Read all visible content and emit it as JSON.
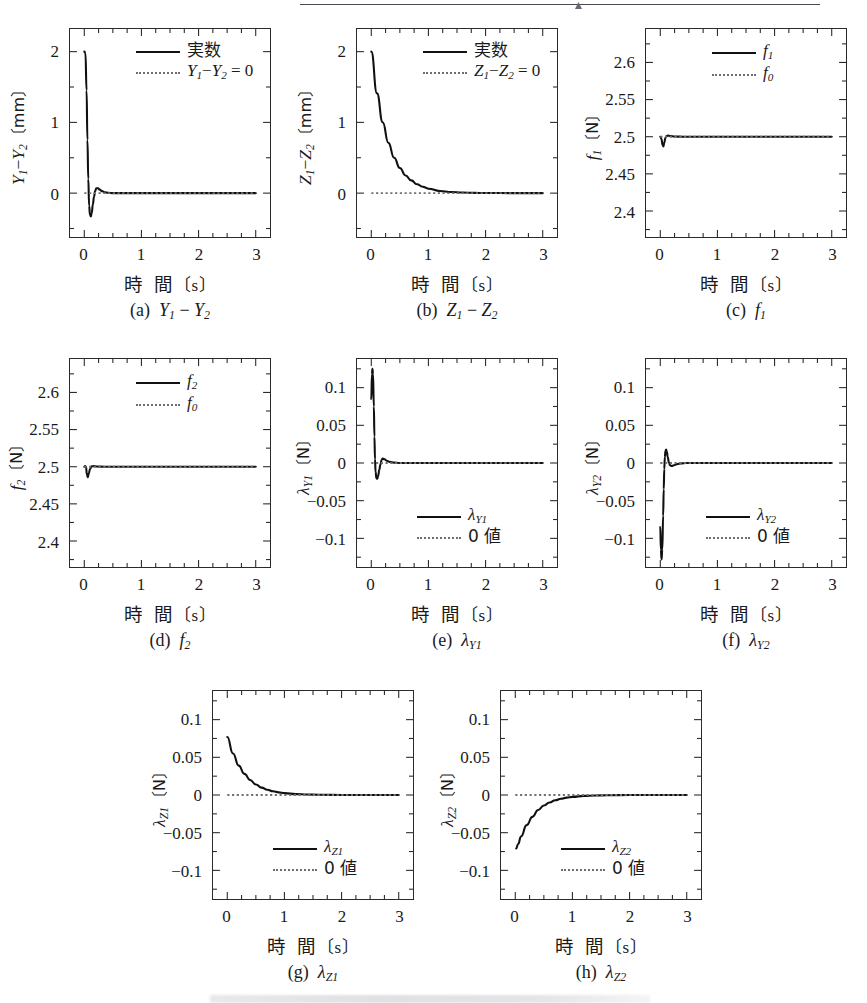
{
  "figure": {
    "layout": "3 rows of subplots (3 + 3 + 2), scanned journal page",
    "xaxis_title_main": "時",
    "xaxis_title_second": "間",
    "xaxis_unit": "〔s〕",
    "x_ticks": [
      "0",
      "1",
      "2",
      "3"
    ],
    "x_range": [
      -0.25,
      3.25
    ]
  },
  "chart_data": [
    {
      "id": "a",
      "type": "line",
      "caption_prefix": "(a)",
      "caption_body": "Y₁ − Y₂",
      "ylabel_main": "Y₁−Y₂",
      "ylabel_unit": "〔mm〕",
      "xlabel": "時　間〔s〕",
      "ylim": [
        -0.62,
        2.32
      ],
      "xlim": [
        -0.25,
        3.25
      ],
      "y_ticks": [
        "0",
        "1",
        "2"
      ],
      "y_tick_values": [
        0,
        1,
        2
      ],
      "x_ticks": [
        "0",
        "1",
        "2",
        "3"
      ],
      "grid": false,
      "legend_position": "top-right",
      "series": [
        {
          "name": "実数",
          "style": "solid",
          "description": "starts at 2.0, drops sharply to -0.33 at t≈0.11, overshoots to +0.07 at t≈0.22, settles to 0",
          "points": [
            [
              0,
              2.0
            ],
            [
              0.02,
              1.98
            ],
            [
              0.04,
              1.45
            ],
            [
              0.055,
              0.75
            ],
            [
              0.07,
              0.2
            ],
            [
              0.085,
              -0.18
            ],
            [
              0.1,
              -0.31
            ],
            [
              0.115,
              -0.33
            ],
            [
              0.13,
              -0.28
            ],
            [
              0.15,
              -0.16
            ],
            [
              0.17,
              -0.05
            ],
            [
              0.19,
              0.03
            ],
            [
              0.21,
              0.068
            ],
            [
              0.24,
              0.07
            ],
            [
              0.27,
              0.05
            ],
            [
              0.31,
              0.028
            ],
            [
              0.36,
              0.012
            ],
            [
              0.42,
              0.004
            ],
            [
              0.5,
              0.0
            ],
            [
              0.7,
              0.0
            ],
            [
              1.0,
              0.0
            ],
            [
              1.5,
              0.0
            ],
            [
              2.0,
              0.0
            ],
            [
              2.5,
              0.0
            ],
            [
              3.0,
              0.0
            ]
          ]
        },
        {
          "name": "Y₁−Y₂ = 0",
          "style": "dotted",
          "description": "horizontal reference line at zero",
          "constant": 0
        }
      ]
    },
    {
      "id": "b",
      "type": "line",
      "caption_prefix": "(b)",
      "caption_body": "Z₁ − Z₂",
      "ylabel_main": "Z₁−Z₂",
      "ylabel_unit": "〔mm〕",
      "xlabel": "時　間〔s〕",
      "ylim": [
        -0.62,
        2.32
      ],
      "xlim": [
        -0.25,
        3.25
      ],
      "y_ticks": [
        "0",
        "1",
        "2"
      ],
      "y_tick_values": [
        0,
        1,
        2
      ],
      "x_ticks": [
        "0",
        "1",
        "2",
        "3"
      ],
      "grid": false,
      "legend_position": "top-right",
      "series": [
        {
          "name": "実数",
          "style": "solid",
          "description": "smooth exponential decay from 2.0 to 0, time constant ≈ 0.29 s",
          "points": [
            [
              0,
              2.0
            ],
            [
              0.1,
              1.41
            ],
            [
              0.2,
              1.0
            ],
            [
              0.3,
              0.71
            ],
            [
              0.4,
              0.5
            ],
            [
              0.5,
              0.355
            ],
            [
              0.6,
              0.25
            ],
            [
              0.7,
              0.18
            ],
            [
              0.8,
              0.125
            ],
            [
              0.9,
              0.09
            ],
            [
              1.0,
              0.063
            ],
            [
              1.2,
              0.031
            ],
            [
              1.4,
              0.015
            ],
            [
              1.6,
              0.008
            ],
            [
              1.8,
              0.004
            ],
            [
              2.0,
              0.002
            ],
            [
              2.5,
              0.0
            ],
            [
              3.0,
              0.0
            ]
          ]
        },
        {
          "name": "Z₁−Z₂ = 0",
          "style": "dotted",
          "description": "horizontal reference line at zero",
          "constant": 0
        }
      ]
    },
    {
      "id": "c",
      "type": "line",
      "caption_prefix": "(c)",
      "caption_body": "f₁",
      "ylabel_main": "f₁",
      "ylabel_unit": "〔N〕",
      "xlabel": "時　間〔s〕",
      "ylim": [
        2.365,
        2.645
      ],
      "xlim": [
        -0.25,
        3.25
      ],
      "y_ticks": [
        "2.4",
        "2.45",
        "2.5",
        "2.55",
        "2.6"
      ],
      "y_tick_values": [
        2.4,
        2.45,
        2.5,
        2.55,
        2.6
      ],
      "x_ticks": [
        "0",
        "1",
        "2",
        "3"
      ],
      "grid": false,
      "legend_position": "top-right",
      "series": [
        {
          "name": "f₁",
          "style": "solid",
          "description": "small dip to 2.487 near t≈0.05 then flat at 2.5",
          "points": [
            [
              0,
              2.5
            ],
            [
              0.02,
              2.497
            ],
            [
              0.04,
              2.489
            ],
            [
              0.055,
              2.487
            ],
            [
              0.07,
              2.492
            ],
            [
              0.09,
              2.4985
            ],
            [
              0.11,
              2.501
            ],
            [
              0.14,
              2.5015
            ],
            [
              0.18,
              2.5008
            ],
            [
              0.25,
              2.5002
            ],
            [
              0.4,
              2.5
            ],
            [
              1.0,
              2.5
            ],
            [
              2.0,
              2.5
            ],
            [
              3.0,
              2.5
            ]
          ]
        },
        {
          "name": "f₀",
          "style": "dotted",
          "description": "horizontal reference line at 2.5 N",
          "constant": 2.5
        }
      ]
    },
    {
      "id": "d",
      "type": "line",
      "caption_prefix": "(d)",
      "caption_body": "f₂",
      "ylabel_main": "f₂",
      "ylabel_unit": "〔N〕",
      "xlabel": "時　間〔s〕",
      "ylim": [
        2.365,
        2.645
      ],
      "xlim": [
        -0.25,
        3.25
      ],
      "y_ticks": [
        "2.4",
        "2.45",
        "2.5",
        "2.55",
        "2.6"
      ],
      "y_tick_values": [
        2.4,
        2.45,
        2.5,
        2.55,
        2.6
      ],
      "x_ticks": [
        "0",
        "1",
        "2",
        "3"
      ],
      "grid": false,
      "legend_position": "top-right",
      "series": [
        {
          "name": "f₂",
          "style": "solid",
          "description": "brief dip to 2.486 near t≈0.06 then flat at 2.5",
          "points": [
            [
              0,
              2.5
            ],
            [
              0.015,
              2.501
            ],
            [
              0.03,
              2.4995
            ],
            [
              0.045,
              2.49
            ],
            [
              0.06,
              2.486
            ],
            [
              0.08,
              2.491
            ],
            [
              0.1,
              2.497
            ],
            [
              0.13,
              2.5005
            ],
            [
              0.17,
              2.5008
            ],
            [
              0.22,
              2.5002
            ],
            [
              0.35,
              2.5
            ],
            [
              1.0,
              2.5
            ],
            [
              2.0,
              2.5
            ],
            [
              3.0,
              2.5
            ]
          ]
        },
        {
          "name": "f₀",
          "style": "dotted",
          "description": "horizontal reference line at 2.5 N",
          "constant": 2.5
        }
      ]
    },
    {
      "id": "e",
      "type": "line",
      "caption_prefix": "(e)",
      "caption_body": "λ_Y1",
      "ylabel_main": "λ_Y1",
      "ylabel_unit": "〔N〕",
      "xlabel": "時　間〔s〕",
      "ylim": [
        -0.138,
        0.138
      ],
      "xlim": [
        -0.25,
        3.25
      ],
      "y_ticks": [
        "-0.1",
        "-0.05",
        "0",
        "0.05",
        "0.1"
      ],
      "y_tick_values": [
        -0.1,
        -0.05,
        0,
        0.05,
        0.1
      ],
      "x_ticks": [
        "0",
        "1",
        "2",
        "3"
      ],
      "grid": false,
      "legend_position": "bottom-center",
      "series": [
        {
          "name": "λ_Y1",
          "style": "solid",
          "description": "spikes to +0.125 at t≈0.02, crosses zero at t≈0.07, min -0.021 at t≈0.11, small bump +0.006, settles to 0",
          "points": [
            [
              0,
              0.085
            ],
            [
              0.012,
              0.118
            ],
            [
              0.02,
              0.125
            ],
            [
              0.03,
              0.118
            ],
            [
              0.045,
              0.075
            ],
            [
              0.055,
              0.035
            ],
            [
              0.065,
              0.005
            ],
            [
              0.075,
              -0.012
            ],
            [
              0.09,
              -0.02
            ],
            [
              0.105,
              -0.021
            ],
            [
              0.12,
              -0.017
            ],
            [
              0.14,
              -0.009
            ],
            [
              0.16,
              -0.002
            ],
            [
              0.18,
              0.004
            ],
            [
              0.2,
              0.006
            ],
            [
              0.23,
              0.005
            ],
            [
              0.27,
              0.003
            ],
            [
              0.32,
              0.0015
            ],
            [
              0.4,
              0.0005
            ],
            [
              0.5,
              0.0
            ],
            [
              1.0,
              0.0
            ],
            [
              2.0,
              0.0
            ],
            [
              3.0,
              0.0
            ]
          ]
        },
        {
          "name": "0 値",
          "style": "dotted",
          "description": "horizontal reference line at zero",
          "constant": 0
        }
      ]
    },
    {
      "id": "f",
      "type": "line",
      "caption_prefix": "(f)",
      "caption_body": "λ_Y2",
      "ylabel_main": "λ_Y2",
      "ylabel_unit": "〔N〕",
      "xlabel": "時　間〔s〕",
      "ylim": [
        -0.138,
        0.138
      ],
      "xlim": [
        -0.25,
        3.25
      ],
      "y_ticks": [
        "-0.1",
        "-0.05",
        "0",
        "0.05",
        "0.1"
      ],
      "y_tick_values": [
        -0.1,
        -0.05,
        0,
        0.05,
        0.1
      ],
      "x_ticks": [
        "0",
        "1",
        "2",
        "3"
      ],
      "grid": false,
      "legend_position": "bottom-center",
      "series": [
        {
          "name": "λ_Y2",
          "style": "solid",
          "description": "starts -0.085, drops to -0.128 at t≈0.025, rises through zero at t≈0.075, peaks +0.018 at t≈0.10, settles to 0",
          "points": [
            [
              0,
              -0.085
            ],
            [
              0.01,
              -0.115
            ],
            [
              0.022,
              -0.128
            ],
            [
              0.035,
              -0.115
            ],
            [
              0.05,
              -0.07
            ],
            [
              0.06,
              -0.035
            ],
            [
              0.07,
              -0.008
            ],
            [
              0.08,
              0.008
            ],
            [
              0.09,
              0.016
            ],
            [
              0.102,
              0.018
            ],
            [
              0.115,
              0.015
            ],
            [
              0.13,
              0.008
            ],
            [
              0.15,
              0.001
            ],
            [
              0.17,
              -0.003
            ],
            [
              0.2,
              -0.004
            ],
            [
              0.24,
              -0.003
            ],
            [
              0.29,
              -0.0015
            ],
            [
              0.36,
              -0.0005
            ],
            [
              0.45,
              0.0
            ],
            [
              1.0,
              0.0
            ],
            [
              2.0,
              0.0
            ],
            [
              3.0,
              0.0
            ]
          ]
        },
        {
          "name": "0 値",
          "style": "dotted",
          "description": "horizontal reference line at zero",
          "constant": 0
        }
      ]
    },
    {
      "id": "g",
      "type": "line",
      "caption_prefix": "(g)",
      "caption_body": "λ_Z1",
      "ylabel_main": "λ_Z1",
      "ylabel_unit": "〔N〕",
      "xlabel": "時　間〔s〕",
      "ylim": [
        -0.138,
        0.138
      ],
      "xlim": [
        -0.25,
        3.25
      ],
      "y_ticks": [
        "-0.1",
        "-0.05",
        "0",
        "0.05",
        "0.1"
      ],
      "y_tick_values": [
        -0.1,
        -0.05,
        0,
        0.05,
        0.1
      ],
      "x_ticks": [
        "0",
        "1",
        "2",
        "3"
      ],
      "grid": false,
      "legend_position": "bottom-center",
      "series": [
        {
          "name": "λ_Z1",
          "style": "solid",
          "description": "exponential decay from +0.077 at t=0 toward 0, time constant ≈ 0.3 s",
          "points": [
            [
              0,
              0.077
            ],
            [
              0.1,
              0.055
            ],
            [
              0.2,
              0.039
            ],
            [
              0.3,
              0.028
            ],
            [
              0.4,
              0.02
            ],
            [
              0.5,
              0.014
            ],
            [
              0.6,
              0.0098
            ],
            [
              0.7,
              0.007
            ],
            [
              0.8,
              0.005
            ],
            [
              0.9,
              0.0035
            ],
            [
              1.0,
              0.0025
            ],
            [
              1.2,
              0.0012
            ],
            [
              1.4,
              0.0006
            ],
            [
              1.6,
              0.0003
            ],
            [
              2.0,
              0.0001
            ],
            [
              2.5,
              0.0
            ],
            [
              3.0,
              0.0
            ]
          ]
        },
        {
          "name": "0 値",
          "style": "dotted",
          "description": "horizontal reference line at zero",
          "constant": 0
        }
      ]
    },
    {
      "id": "h",
      "type": "line",
      "caption_prefix": "(h)",
      "caption_body": "λ_Z2",
      "ylabel_main": "λ_Z2",
      "ylabel_unit": "〔N〕",
      "xlabel": "時　間〔s〕",
      "ylim": [
        -0.138,
        0.138
      ],
      "xlim": [
        -0.25,
        3.25
      ],
      "y_ticks": [
        "-0.1",
        "-0.05",
        "0",
        "0.05",
        "0.1"
      ],
      "y_tick_values": [
        -0.1,
        -0.05,
        0,
        0.05,
        0.1
      ],
      "x_ticks": [
        "0",
        "1",
        "2",
        "3"
      ],
      "grid": false,
      "legend_position": "bottom-center",
      "series": [
        {
          "name": "λ_Z2",
          "style": "solid",
          "description": "exponential rise from -0.071 at t≈0.02 toward 0, time constant ≈ 0.3 s",
          "points": [
            [
              0.015,
              -0.071
            ],
            [
              0.05,
              -0.065
            ],
            [
              0.1,
              -0.055
            ],
            [
              0.2,
              -0.04
            ],
            [
              0.3,
              -0.029
            ],
            [
              0.4,
              -0.02
            ],
            [
              0.5,
              -0.014
            ],
            [
              0.6,
              -0.01
            ],
            [
              0.7,
              -0.007
            ],
            [
              0.8,
              -0.005
            ],
            [
              0.9,
              -0.0035
            ],
            [
              1.0,
              -0.0025
            ],
            [
              1.2,
              -0.0012
            ],
            [
              1.4,
              -0.0006
            ],
            [
              1.6,
              -0.0003
            ],
            [
              2.0,
              -0.0001
            ],
            [
              2.5,
              0.0
            ],
            [
              3.0,
              0.0
            ]
          ]
        },
        {
          "name": "0 値",
          "style": "dotted",
          "description": "horizontal reference line at zero",
          "constant": 0
        }
      ]
    }
  ]
}
